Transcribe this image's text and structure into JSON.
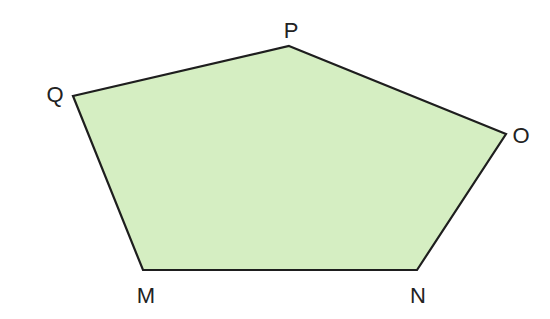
{
  "diagram": {
    "shape": "pentagon",
    "fill_color": "#d5eec2",
    "stroke_color": "#1e1e1e",
    "vertices": [
      {
        "label": "P",
        "x": 289,
        "y": 46,
        "label_x": 291,
        "label_y": 38
      },
      {
        "label": "O",
        "x": 506,
        "y": 134,
        "label_x": 521,
        "label_y": 143
      },
      {
        "label": "N",
        "x": 417,
        "y": 270,
        "label_x": 418,
        "label_y": 303
      },
      {
        "label": "M",
        "x": 143,
        "y": 270,
        "label_x": 146,
        "label_y": 303
      },
      {
        "label": "Q",
        "x": 73,
        "y": 96,
        "label_x": 55,
        "label_y": 102
      }
    ]
  }
}
